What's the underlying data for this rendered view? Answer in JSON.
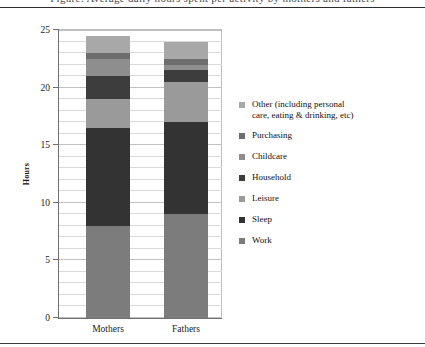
{
  "caption": "Figure: Average daily hours spent per activity by mothers and fathers",
  "chart_data": {
    "type": "bar",
    "subtype": "stacked-column",
    "title": "",
    "xlabel": "",
    "ylabel": "Hours",
    "ylim": [
      0,
      25
    ],
    "ytick_step": 5,
    "yticks": [
      0,
      5,
      10,
      15,
      20,
      25
    ],
    "ytick_labels": [
      "0",
      "5",
      "10",
      "15",
      "20",
      "25"
    ],
    "grid": true,
    "grid_minor_step": 1,
    "legend_position": "right",
    "categories": [
      "Mothers",
      "Fathers"
    ],
    "stack_order_bottom_to_top": [
      "Work",
      "Sleep",
      "Leisure",
      "Household",
      "Childcare",
      "Purchasing",
      "Other (including personal care, eating & drinking, etc)"
    ],
    "series": [
      {
        "name": "Work",
        "values": [
          8.0,
          9.0
        ],
        "color": "#7c7c7c"
      },
      {
        "name": "Sleep",
        "values": [
          8.5,
          8.0
        ],
        "color": "#333333"
      },
      {
        "name": "Leisure",
        "values": [
          2.5,
          3.5
        ],
        "color": "#9a9a9a"
      },
      {
        "name": "Household",
        "values": [
          2.0,
          1.0
        ],
        "color": "#3d3d3d"
      },
      {
        "name": "Childcare",
        "values": [
          1.5,
          0.5
        ],
        "color": "#8e8e8e"
      },
      {
        "name": "Purchasing",
        "values": [
          0.5,
          0.5
        ],
        "color": "#6e6e6e"
      },
      {
        "name": "Other (including personal care, eating & drinking, etc)",
        "values": [
          1.5,
          1.5
        ],
        "color": "#a8a8a8"
      }
    ],
    "totals": [
      24.0,
      24.0
    ]
  },
  "legend": {
    "items": [
      {
        "label_line1": "Other (including personal",
        "label_line2": "care, eating & drinking, etc)",
        "color": "#a8a8a8"
      },
      {
        "label_line1": "Purchasing",
        "label_line2": "",
        "color": "#6e6e6e"
      },
      {
        "label_line1": "Childcare",
        "label_line2": "",
        "color": "#8e8e8e"
      },
      {
        "label_line1": "Household",
        "label_line2": "",
        "color": "#3d3d3d"
      },
      {
        "label_line1": "Leisure",
        "label_line2": "",
        "color": "#9a9a9a"
      },
      {
        "label_line1": "Sleep",
        "label_line2": "",
        "color": "#333333"
      },
      {
        "label_line1": "Work",
        "label_line2": "",
        "color": "#7c7c7c"
      }
    ]
  }
}
